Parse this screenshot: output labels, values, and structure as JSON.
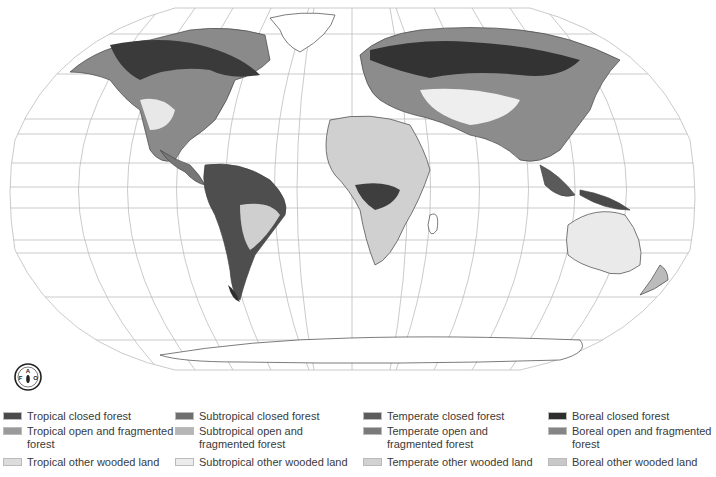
{
  "map": {
    "type": "world forest cover map (Robinson projection)",
    "publisher_logo": "FAO",
    "logo_text": "FAO",
    "colors": {
      "graticule": "#b8b8b8",
      "coastline": "#444444",
      "land": "#f2f2f2"
    }
  },
  "legend": {
    "columns": [
      {
        "items": [
          {
            "label": "Tropical closed forest",
            "color": "#4a4a4a"
          },
          {
            "label": "Tropical open and fragmented forest",
            "color": "#9a9a9a"
          },
          {
            "label": "Tropical other wooded land",
            "color": "#dcdcdc"
          }
        ]
      },
      {
        "items": [
          {
            "label": "Subtropical closed forest",
            "color": "#6e6e6e"
          },
          {
            "label": "Subtropical open and fragmented forest",
            "color": "#b6b6b6"
          },
          {
            "label": "Subtropical other wooded land",
            "color": "#ececec"
          }
        ]
      },
      {
        "items": [
          {
            "label": "Temperate closed forest",
            "color": "#5c5c5c"
          },
          {
            "label": "Temperate open and fragmented forest",
            "color": "#7a7a7a"
          },
          {
            "label": "Temperate other wooded land",
            "color": "#d2d2d2"
          }
        ]
      },
      {
        "items": [
          {
            "label": "Boreal closed forest",
            "color": "#2e2e2e"
          },
          {
            "label": "Boreal open and fragmented forest",
            "color": "#858585"
          },
          {
            "label": "Boreal other wooded land",
            "color": "#c8c8c8"
          }
        ]
      }
    ]
  }
}
